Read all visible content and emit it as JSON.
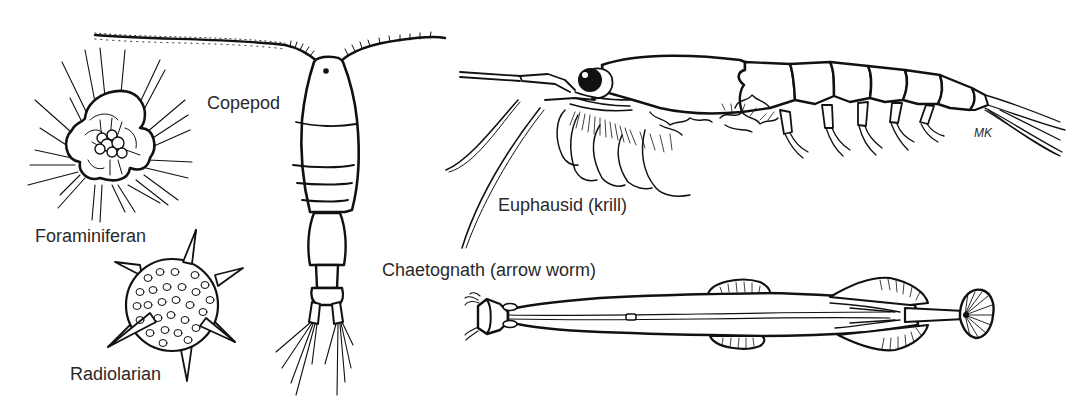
{
  "figure": {
    "organisms": [
      {
        "id": "foraminiferan",
        "label": "Foraminiferan"
      },
      {
        "id": "radiolarian",
        "label": "Radiolarian"
      },
      {
        "id": "copepod",
        "label": "Copepod"
      },
      {
        "id": "euphausid",
        "label": "Euphausid (krill)"
      },
      {
        "id": "chaetognath",
        "label": "Chaetognath (arrow worm)"
      }
    ],
    "signature": "MK",
    "colors": {
      "ink": "#111111",
      "background": "#ffffff",
      "label": "#2a2a2a"
    }
  }
}
